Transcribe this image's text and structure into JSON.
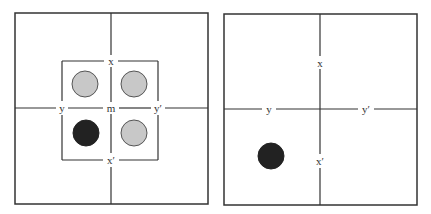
{
  "colors": {
    "line": "#333333",
    "gray_circle_fill": "#c8c8c8",
    "gray_circle_stroke": "#555555",
    "black_circle_fill": "#222222",
    "background": "#ffffff"
  },
  "panels": [
    {
      "id": "left",
      "frame": {
        "x": 15,
        "y": 13,
        "w": 193,
        "h": 191
      },
      "axes": {
        "cx": 111,
        "cy": 108
      },
      "inner_square": {
        "x": 62,
        "y": 61,
        "w": 96,
        "h": 99
      },
      "labels": {
        "top": "x",
        "bottom": "x′",
        "left": "y",
        "right": "y′",
        "center": "m"
      },
      "label_positions": {
        "top": {
          "x": 111,
          "y": 61
        },
        "bottom": {
          "x": 111,
          "y": 160
        },
        "left": {
          "x": 62,
          "y": 108
        },
        "right": {
          "x": 158,
          "y": 108
        },
        "center": {
          "x": 111,
          "y": 108
        }
      },
      "circles": [
        {
          "name": "top-left",
          "cx": 85,
          "cy": 84,
          "r": 13,
          "style": "gray"
        },
        {
          "name": "top-right",
          "cx": 134,
          "cy": 84,
          "r": 13,
          "style": "gray"
        },
        {
          "name": "bottom-left",
          "cx": 86,
          "cy": 133,
          "r": 13,
          "style": "black"
        },
        {
          "name": "bottom-right",
          "cx": 134,
          "cy": 133,
          "r": 13,
          "style": "gray"
        }
      ]
    },
    {
      "id": "right",
      "frame": {
        "x": 224,
        "y": 14,
        "w": 193,
        "h": 191
      },
      "axes": {
        "cx": 320,
        "cy": 109
      },
      "labels": {
        "top": "x",
        "bottom": "x′",
        "left": "y",
        "right": "y′"
      },
      "label_positions": {
        "top": {
          "x": 320,
          "y": 63
        },
        "bottom": {
          "x": 320,
          "y": 161
        },
        "left": {
          "x": 269,
          "y": 109
        },
        "right": {
          "x": 366,
          "y": 109
        }
      },
      "circles": [
        {
          "name": "bottom-left",
          "cx": 271,
          "cy": 156,
          "r": 13,
          "style": "black"
        }
      ]
    }
  ]
}
